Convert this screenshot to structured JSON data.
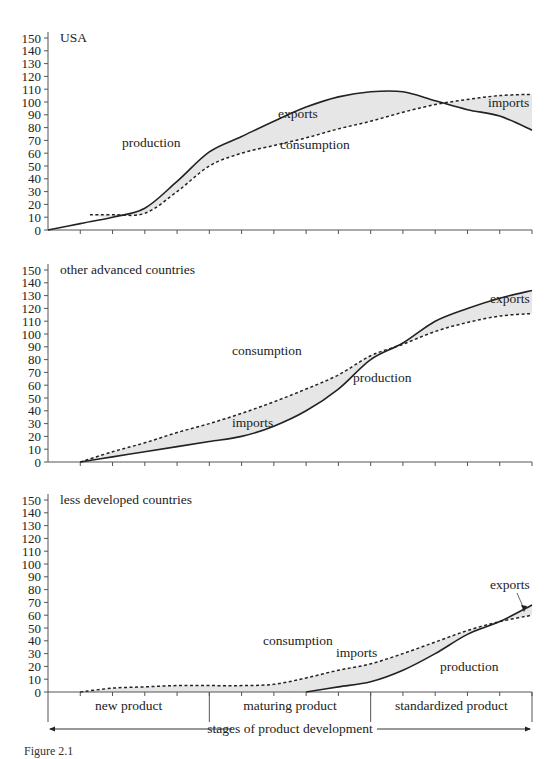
{
  "chart_data": [
    {
      "type": "line",
      "title": "USA",
      "xlabel": "stages of product development",
      "ylabel": "",
      "ylim": [
        0,
        150
      ],
      "yticks": [
        0,
        10,
        20,
        30,
        40,
        50,
        60,
        70,
        80,
        90,
        100,
        110,
        120,
        130,
        140,
        150
      ],
      "x": [
        0,
        1,
        2,
        3,
        4,
        5,
        6,
        7,
        8,
        9,
        10,
        11,
        12,
        13,
        14,
        15
      ],
      "grid": false,
      "legend": "none (inline labels)",
      "series": [
        {
          "name": "production",
          "style": "solid",
          "values": [
            0,
            5,
            10,
            17,
            38,
            61,
            73,
            85,
            96,
            104,
            108,
            108,
            101,
            94,
            89,
            78
          ]
        },
        {
          "name": "consumption",
          "style": "dashed",
          "values": [
            null,
            null,
            12,
            13,
            30,
            50,
            60,
            66,
            72,
            79,
            85,
            92,
            98,
            102,
            105,
            106
          ]
        }
      ],
      "shaded_regions": [
        {
          "label": "exports",
          "between": [
            "production",
            "consumption"
          ],
          "where": "production > consumption"
        },
        {
          "label": "imports",
          "between": [
            "consumption",
            "production"
          ],
          "where": "consumption > production"
        }
      ],
      "annotations": [
        "production",
        "exports",
        "consumption",
        "imports"
      ]
    },
    {
      "type": "line",
      "title": "other advanced countries",
      "ylim": [
        0,
        150
      ],
      "yticks": [
        0,
        10,
        20,
        30,
        40,
        50,
        60,
        70,
        80,
        90,
        100,
        110,
        120,
        130,
        140,
        150
      ],
      "x": [
        0,
        1,
        2,
        3,
        4,
        5,
        6,
        7,
        8,
        9,
        10,
        11,
        12,
        13,
        14,
        15
      ],
      "grid": false,
      "series": [
        {
          "name": "production",
          "style": "solid",
          "values": [
            null,
            0,
            4,
            8,
            12,
            16,
            20,
            28,
            40,
            57,
            80,
            93,
            110,
            120,
            128,
            134
          ]
        },
        {
          "name": "consumption",
          "style": "dashed",
          "values": [
            null,
            0,
            8,
            15,
            23,
            30,
            38,
            47,
            57,
            68,
            83,
            92,
            102,
            109,
            114,
            116
          ]
        }
      ],
      "shaded_regions": [
        {
          "label": "imports",
          "where": "consumption > production"
        },
        {
          "label": "exports",
          "where": "production > consumption"
        }
      ],
      "annotations": [
        "consumption",
        "imports",
        "production",
        "exports"
      ]
    },
    {
      "type": "line",
      "title": "less developed countries",
      "ylim": [
        0,
        150
      ],
      "yticks": [
        0,
        10,
        20,
        30,
        40,
        50,
        60,
        70,
        80,
        90,
        100,
        110,
        120,
        130,
        140,
        150
      ],
      "x": [
        0,
        1,
        2,
        3,
        4,
        5,
        6,
        7,
        8,
        9,
        10,
        11,
        12,
        13,
        14,
        15
      ],
      "grid": false,
      "series": [
        {
          "name": "production",
          "style": "solid",
          "values": [
            null,
            null,
            null,
            null,
            null,
            null,
            null,
            null,
            0,
            4,
            8,
            17,
            30,
            45,
            55,
            68
          ]
        },
        {
          "name": "consumption",
          "style": "dashed",
          "values": [
            null,
            0,
            3,
            4,
            5,
            5,
            5,
            6,
            11,
            17,
            22,
            30,
            39,
            48,
            55,
            60
          ]
        }
      ],
      "shaded_regions": [
        {
          "label": "imports",
          "where": "consumption > production"
        },
        {
          "label": "exports",
          "where": "production > consumption"
        }
      ],
      "annotations": [
        "consumption",
        "imports",
        "production",
        "exports"
      ]
    }
  ],
  "panels": [
    {
      "title": "USA",
      "labels": {
        "production": "production",
        "exports": "exports",
        "consumption": "consumption",
        "imports": "imports"
      }
    },
    {
      "title": "other advanced countries",
      "labels": {
        "consumption": "consumption",
        "imports": "imports",
        "production": "production",
        "exports": "exports"
      }
    },
    {
      "title": "less developed countries",
      "labels": {
        "consumption": "consumption",
        "imports": "imports",
        "production": "production",
        "exports": "exports"
      }
    }
  ],
  "stages": [
    "new product",
    "maturing product",
    "standardized product"
  ],
  "stages_axis_label": "stages of product development",
  "caption": "Figure 2.1"
}
